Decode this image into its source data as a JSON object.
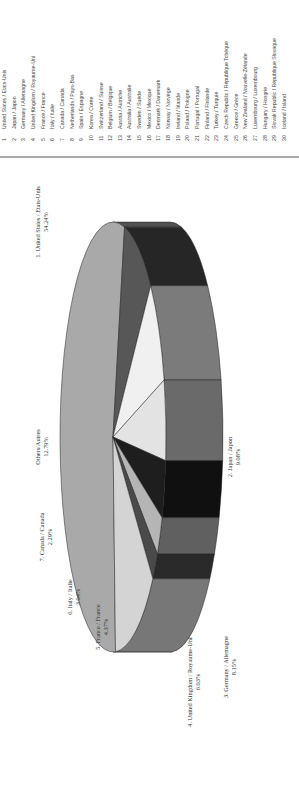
{
  "chart_data": {
    "type": "pie",
    "style": "3d-pie, page rotated 90deg counter-clockwise",
    "title": "",
    "slices": [
      {
        "rank": 1,
        "label": "1. United States / Etats-Unis",
        "value": 54.24,
        "value_label": "54.24%",
        "color": "#a9a9a9",
        "side_color": "#505050"
      },
      {
        "rank": 2,
        "label": "2. Japan / Japon",
        "value": 9.08,
        "value_label": "9.08%",
        "color": "#575757",
        "side_color": "#262626"
      },
      {
        "rank": 3,
        "label": "3. Germany / Allemagne",
        "value": 8.15,
        "value_label": "8.15%",
        "color": "#f0f0f0",
        "side_color": "#7b7b7b"
      },
      {
        "rank": 4,
        "label": "4. United Kingdom / Royaume-Uni",
        "value": 6.03,
        "value_label": "6.03%",
        "color": "#e3e3e3",
        "side_color": "#6a6a6a"
      },
      {
        "rank": 5,
        "label": "5. France / France",
        "value": 4.37,
        "value_label": "4.37%",
        "color": "#1e1e1e",
        "side_color": "#101010"
      },
      {
        "rank": 6,
        "label": "6. Italy / Italie",
        "value": 3.04,
        "value_label": "3.04%",
        "color": "#b5b5b5",
        "side_color": "#606060"
      },
      {
        "rank": 7,
        "label": "7. Canada / Canada",
        "value": 2.29,
        "value_label": "2.29%",
        "color": "#4a4a4a",
        "side_color": "#2a2a2a"
      },
      {
        "rank": 0,
        "label": "Others/Autres",
        "value": 12.79,
        "value_label": "12.79%",
        "color": "#d4d4d4",
        "side_color": "#777777"
      }
    ],
    "legend_position": "top (rotated: left column list)",
    "legend": [
      {
        "n": "1",
        "name": "United States / Etats-Unis"
      },
      {
        "n": "2",
        "name": "Japan / Japon"
      },
      {
        "n": "3",
        "name": "Germany / Allemagne"
      },
      {
        "n": "4",
        "name": "United Kingdom / Royaume-Uni"
      },
      {
        "n": "5",
        "name": "France / France"
      },
      {
        "n": "6",
        "name": "Italy / Italie"
      },
      {
        "n": "7",
        "name": "Canada / Canada"
      },
      {
        "n": "8",
        "name": "Netherlands / Pays-Bas"
      },
      {
        "n": "9",
        "name": "Spain / Espagne"
      },
      {
        "n": "10",
        "name": "Korea / Corée"
      },
      {
        "n": "11",
        "name": "Switzerland / Suisse"
      },
      {
        "n": "12",
        "name": "Belgium / Belgique"
      },
      {
        "n": "13",
        "name": "Austria / Autriche"
      },
      {
        "n": "14",
        "name": "Australia / Australie"
      },
      {
        "n": "15",
        "name": "Sweden / Suède"
      },
      {
        "n": "16",
        "name": "Mexico / Mexique"
      },
      {
        "n": "17",
        "name": "Denmark / Danemark"
      },
      {
        "n": "18",
        "name": "Norway / Norvège"
      },
      {
        "n": "19",
        "name": "Ireland / Irlande"
      },
      {
        "n": "20",
        "name": "Poland / Pologne"
      },
      {
        "n": "21",
        "name": "Portugal / Portugal"
      },
      {
        "n": "22",
        "name": "Finland / Finlande"
      },
      {
        "n": "23",
        "name": "Turkey / Turquie"
      },
      {
        "n": "24",
        "name": "Czech Republic / République Tchèque"
      },
      {
        "n": "25",
        "name": "Greece / Grèce"
      },
      {
        "n": "26",
        "name": "New Zealand / Nouvelle-Zélande"
      },
      {
        "n": "27",
        "name": "Luxembourg / Luxembourg"
      },
      {
        "n": "28",
        "name": "Hungary / Hongrie"
      },
      {
        "n": "29",
        "name": "Slovak Republic / République Slovaque"
      },
      {
        "n": "30",
        "name": "Iceland / Island"
      }
    ]
  }
}
